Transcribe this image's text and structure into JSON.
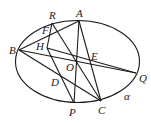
{
  "diagram": {
    "type": "geometry",
    "plane_label": "α",
    "ellipse": {
      "cx": 77.5,
      "cy": 61.5,
      "rx": 62,
      "ry": 41
    },
    "points": [
      {
        "name": "A",
        "x": 79,
        "y": 21,
        "lx": 76,
        "ly": 17
      },
      {
        "name": "R",
        "x": 52,
        "y": 23,
        "lx": 49,
        "ly": 19
      },
      {
        "name": "F",
        "x": 49,
        "y": 32,
        "lx": 42,
        "ly": 34
      },
      {
        "name": "B",
        "x": 19,
        "y": 50,
        "lx": 9,
        "ly": 54
      },
      {
        "name": "H",
        "x": 47,
        "y": 48,
        "lx": 36,
        "ly": 50
      },
      {
        "name": "E",
        "x": 91,
        "y": 62,
        "lx": 91,
        "ly": 60
      },
      {
        "name": "O",
        "x": 77,
        "y": 61,
        "lx": 66,
        "ly": 71
      },
      {
        "name": "Q",
        "x": 136,
        "y": 73,
        "lx": 139,
        "ly": 82
      },
      {
        "name": "D",
        "x": 60,
        "y": 80,
        "lx": 51,
        "ly": 86
      },
      {
        "name": "P",
        "x": 74,
        "y": 103,
        "lx": 69,
        "ly": 116
      },
      {
        "name": "C",
        "x": 101,
        "y": 101,
        "lx": 98,
        "ly": 114
      }
    ],
    "segments": [
      [
        "B",
        "A"
      ],
      [
        "B",
        "Q"
      ],
      [
        "B",
        "C"
      ],
      [
        "A",
        "P"
      ],
      [
        "A",
        "C"
      ],
      [
        "R",
        "C"
      ],
      [
        "R",
        "H"
      ],
      [
        "H",
        "Q"
      ],
      [
        "H",
        "P"
      ]
    ],
    "alpha_label_pos": {
      "x": 124,
      "y": 100
    }
  }
}
